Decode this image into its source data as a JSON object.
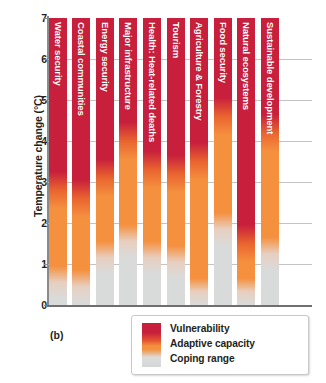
{
  "figure": {
    "panel_label": "(b)",
    "y_axis_title": "Temperature change (°C)"
  },
  "legend": {
    "items": [
      {
        "label": "Vulnerability",
        "color": "#c8203c"
      },
      {
        "label": "Adaptive capacity",
        "color": "#f5903f"
      },
      {
        "label": "Coping range",
        "color": "#d9dbda"
      }
    ]
  },
  "chart_data": {
    "type": "bar",
    "title": "",
    "xlabel": "",
    "ylabel": "Temperature change (°C)",
    "ylim": [
      0,
      7
    ],
    "yticks": [
      0,
      1,
      2,
      3,
      4,
      5,
      6,
      7
    ],
    "ytick_labels": [
      "0",
      "1",
      "2",
      "3",
      "4",
      "5",
      "6",
      "7"
    ],
    "grid": true,
    "legend_position": "bottom-right",
    "value_unit": "°C",
    "categories": [
      "Water security",
      "Coastal communities",
      "Energy security",
      "Major infrastructure",
      "Health: Heat-related deaths",
      "Tourism",
      "Agriculture & Forestry",
      "Food security",
      "Natural ecosystems",
      "Sustainable development"
    ],
    "series": [
      {
        "name": "Coping range upper bound (°C)",
        "values": [
          0.4,
          0.3,
          1.0,
          1.4,
          1.0,
          0.9,
          0.1,
          1.7,
          0.1,
          1.1
        ]
      },
      {
        "name": "Adaptive capacity upper bound (°C)",
        "values": [
          2.8,
          2.6,
          3.1,
          4.0,
          3.3,
          3.2,
          3.5,
          4.6,
          1.5,
          4.2
        ]
      },
      {
        "name": "Vulnerability top (°C)",
        "values": [
          7,
          7,
          7,
          7,
          7,
          7,
          7,
          7,
          7,
          7
        ]
      }
    ]
  },
  "bars": [
    {
      "label": "Water security",
      "cope": 0.4,
      "adapt": 2.8
    },
    {
      "label": "Coastal communities",
      "cope": 0.3,
      "adapt": 2.6
    },
    {
      "label": "Energy security",
      "cope": 1.0,
      "adapt": 3.1
    },
    {
      "label": "Major infrastructure",
      "cope": 1.4,
      "adapt": 4.0
    },
    {
      "label": "Health: Heat-related deaths",
      "cope": 1.0,
      "adapt": 3.3
    },
    {
      "label": "Tourism",
      "cope": 0.9,
      "adapt": 3.2
    },
    {
      "label": "Agriculture & Forestry",
      "cope": 0.1,
      "adapt": 3.5
    },
    {
      "label": "Food security",
      "cope": 1.7,
      "adapt": 4.6
    },
    {
      "label": "Natural ecosystems",
      "cope": 0.1,
      "adapt": 1.5
    },
    {
      "label": "Sustainable development",
      "cope": 1.1,
      "adapt": 4.2
    }
  ],
  "colors": {
    "vulnerability": "#c8203c",
    "adaptive_capacity": "#f5903f",
    "coping_range": "#d9dbda",
    "axis": "#8a8a8a",
    "grid": "#b9b9b9",
    "text": "#231f20"
  }
}
